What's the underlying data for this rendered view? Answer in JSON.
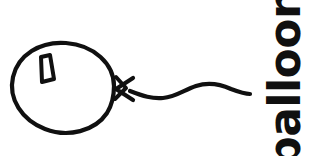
{
  "card": {
    "title": "balloon",
    "background_color": "#ffffff",
    "ink_color": "#101010",
    "width": 316,
    "height": 156
  },
  "label": {
    "text": "balloon",
    "orientation": "rotated-90-counterclockwise",
    "color": "#101010"
  },
  "illustration": {
    "name": "balloon-line-drawing",
    "style": "hand-drawn black ink outline",
    "stroke_color": "#101010",
    "parts": [
      {
        "name": "balloon-body",
        "shape": "oval outline",
        "bounds": {
          "x": 12,
          "y": 42,
          "width": 106,
          "height": 90
        }
      },
      {
        "name": "balloon-highlight",
        "shape": "small wedge quadrilateral",
        "bounds": {
          "x": 38,
          "y": 56,
          "width": 16,
          "height": 24
        }
      },
      {
        "name": "balloon-knot",
        "shape": "bowtie arrowhead",
        "bounds": {
          "x": 113,
          "y": 76,
          "width": 24,
          "height": 26
        }
      },
      {
        "name": "balloon-string",
        "shape": "wavy line",
        "bounds": {
          "x": 133,
          "y": 82,
          "width": 117,
          "height": 16
        }
      }
    ]
  }
}
